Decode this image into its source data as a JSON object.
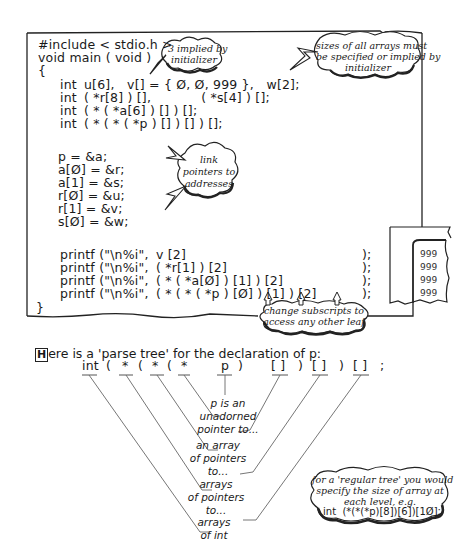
{
  "code": {
    "lines": [
      "#include < stdio.h >",
      "void main ( void )",
      "{"
    ],
    "decls": [
      {
        "kw": "int",
        "text": "u[6],   v[] = { Ø, Ø, 999 },   w[2];"
      },
      {
        "kw": "int",
        "text": "( *r[8] ) [],            ( *s[4] ) [];"
      },
      {
        "kw": "int",
        "text": "( * ( *a[6] ) [] ) [];"
      },
      {
        "kw": "int",
        "text": "( * ( * ( *p ) [] ) [] ) [];"
      }
    ],
    "assigns": [
      "p = &a;",
      "a[Ø] = &r;",
      "a[1] = &s;",
      "r[Ø] = &u;",
      "r[1] = &v;",
      "s[Ø] = &w;"
    ],
    "printfs": [
      {
        "fn": "printf (\"\\n%i\",",
        "expr": "v [2]",
        "end": ");"
      },
      {
        "fn": "printf (\"\\n%i\",",
        "expr": "( *r[1] ) [2]",
        "end": ");"
      },
      {
        "fn": "printf (\"\\n%i\",",
        "expr": "( * ( *a[Ø] ) [1] ) [2]",
        "end": ");"
      },
      {
        "fn": "printf (\"\\n%i\",",
        "expr": "( * ( * ( *p ) [Ø] ) [1] ) [2]",
        "end": ");"
      }
    ],
    "close": "}"
  },
  "callouts": {
    "implied": "3 implied by\ninitializer",
    "sizes": "sizes of all arrays must\nbe specified or implied by\ninitializer",
    "link": "link\npointers to\naddresses",
    "change": "change subscripts to\naccess any other leaf",
    "regular": "for a 'regular tree' you would\nspecify the size of array at\neach level, e.g.",
    "regular_code": "int  (*(*(*p)[8])[6])[1Ø];"
  },
  "output": {
    "values": [
      "999",
      "999",
      "999",
      "999"
    ]
  },
  "intro": {
    "dropcap": "H",
    "text": "ere is a 'parse tree' for the declaration of p:"
  },
  "tree": {
    "tokens": [
      "int",
      "(",
      "*",
      "(",
      "*",
      "(",
      "*",
      "p",
      ")",
      "[ ]",
      ")",
      "[ ]",
      ")",
      "[ ]",
      ";"
    ],
    "labels": {
      "p": "p is an\nunadorned\npointer to...",
      "array_ptrs": "an array\nof pointers\nto...",
      "arrays_ptrs": "arrays\nof pointers\nto...",
      "arrays_int": "arrays\nof int"
    }
  }
}
